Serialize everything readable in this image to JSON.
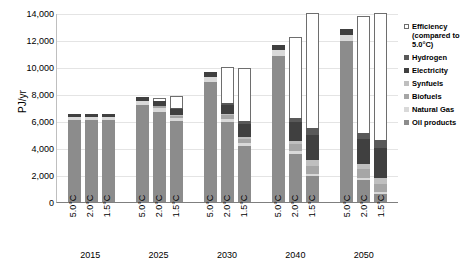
{
  "chart_data": {
    "type": "bar",
    "stacked": true,
    "title": "",
    "xlabel": "",
    "ylabel": "PJ/yr",
    "ylim": [
      0,
      14000
    ],
    "ytick_values": [
      0,
      2000,
      4000,
      6000,
      8000,
      10000,
      12000,
      14000
    ],
    "ytick_labels": [
      "0",
      "2,000",
      "4,000",
      "6,000",
      "8,000",
      "10,000",
      "12,000",
      "14,000"
    ],
    "grid": true,
    "legend_position": "right",
    "groups": [
      {
        "label": "2015",
        "scenarios": [
          "5.0°C",
          "2.0°C",
          "1.5°C"
        ]
      },
      {
        "label": "2025",
        "scenarios": [
          "5.0°C",
          "2.0°C",
          "1.5°C"
        ]
      },
      {
        "label": "2030",
        "scenarios": [
          "5.0°C",
          "2.0°C",
          "1.5°C"
        ]
      },
      {
        "label": "2040",
        "scenarios": [
          "5.0°C",
          "2.0°C",
          "1.5°C"
        ]
      },
      {
        "label": "2050",
        "scenarios": [
          "5.0°C",
          "2.0°C",
          "1.5°C"
        ]
      }
    ],
    "series": [
      {
        "name": "Oil products",
        "color": "#8c8c8c",
        "values": [
          6050,
          6050,
          6050,
          7200,
          6700,
          6000,
          8900,
          5900,
          4150,
          10800,
          3550,
          1950,
          11900,
          1600,
          700
        ]
      },
      {
        "name": "Natural Gas",
        "color": "#d9d9d9",
        "values": [
          250,
          250,
          250,
          300,
          250,
          200,
          350,
          250,
          200,
          450,
          250,
          150,
          500,
          200,
          100
        ]
      },
      {
        "name": "Biofuels",
        "color": "#a6a6a6",
        "values": [
          0,
          0,
          0,
          0,
          150,
          200,
          0,
          300,
          350,
          0,
          500,
          600,
          0,
          650,
          700
        ]
      },
      {
        "name": "Synfuels",
        "color": "#bfbfbf",
        "values": [
          0,
          0,
          0,
          0,
          0,
          50,
          0,
          100,
          150,
          0,
          250,
          400,
          0,
          350,
          500
        ]
      },
      {
        "name": "Electricity",
        "color": "#404040",
        "values": [
          200,
          200,
          200,
          250,
          350,
          450,
          350,
          650,
          900,
          400,
          1350,
          1850,
          450,
          1850,
          2500
        ]
      },
      {
        "name": "Hydrogen",
        "color": "#595959",
        "values": [
          0,
          0,
          0,
          0,
          50,
          100,
          0,
          150,
          250,
          0,
          350,
          500,
          0,
          450,
          700
        ]
      },
      {
        "name": "Efficiency (compared to 5.0°C)",
        "color": "#ffffff",
        "values": [
          0,
          0,
          0,
          0,
          200,
          850,
          0,
          2650,
          3950,
          0,
          6000,
          8550,
          0,
          8700,
          10600
        ]
      }
    ],
    "totals": [
      6500,
      6500,
      6500,
      7750,
      7700,
      7850,
      9600,
      10000,
      9950,
      11650,
      12250,
      14000,
      12850,
      13800,
      15800
    ]
  },
  "legend": {
    "items": [
      {
        "label": "Efficiency (compared to 5.0°C)",
        "swatch": "hollow",
        "color": "#ffffff"
      },
      {
        "label": "Hydrogen",
        "swatch": "solid",
        "color": "#595959"
      },
      {
        "label": "Electricity",
        "swatch": "solid",
        "color": "#404040"
      },
      {
        "label": "Synfuels",
        "swatch": "solid",
        "color": "#bfbfbf"
      },
      {
        "label": "Biofuels",
        "swatch": "solid",
        "color": "#a6a6a6"
      },
      {
        "label": "Natural Gas",
        "swatch": "solid",
        "color": "#d9d9d9"
      },
      {
        "label": "Oil products",
        "swatch": "solid",
        "color": "#8c8c8c"
      }
    ]
  }
}
